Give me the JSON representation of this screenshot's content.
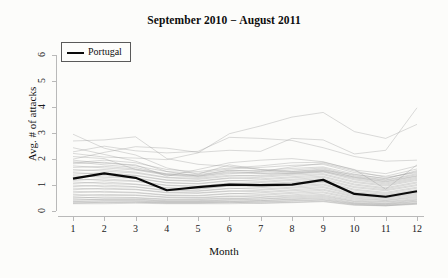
{
  "chart_data": {
    "type": "line",
    "title": "September 2010 − August 2011",
    "xlabel": "Month",
    "ylabel": "Avg. # of attacks",
    "xlim": [
      1,
      12
    ],
    "ylim": [
      0,
      6.4
    ],
    "x": [
      1,
      2,
      3,
      4,
      5,
      6,
      7,
      8,
      9,
      10,
      11,
      12
    ],
    "xticks": [
      "1",
      "2",
      "3",
      "4",
      "5",
      "6",
      "7",
      "8",
      "9",
      "10",
      "11",
      "12"
    ],
    "yticks": [
      "0",
      "1",
      "2",
      "3",
      "4",
      "5",
      "6"
    ],
    "grid": false,
    "legend": {
      "position": "top-left",
      "entries": [
        {
          "name": "Portugal",
          "color": "#0a0a0a",
          "width": 2.2
        }
      ]
    },
    "highlight_color": "#0a0a0a",
    "background_color": "#fcfcfa",
    "axis_color": "#b9b9b9",
    "background_series_color": "#9a9a9a",
    "series": [
      {
        "name": "Portugal",
        "highlight": true,
        "values": [
          1.25,
          1.45,
          1.28,
          0.8,
          0.92,
          1.02,
          1.0,
          1.02,
          1.2,
          0.66,
          0.55,
          0.76
        ]
      },
      {
        "name": "bg-01",
        "highlight": false,
        "values": [
          2.96,
          2.42,
          2.16,
          1.66,
          1.42,
          1.78,
          1.6,
          1.52,
          1.58,
          1.4,
          1.26,
          1.52
        ]
      },
      {
        "name": "bg-02",
        "highlight": false,
        "values": [
          2.7,
          2.74,
          2.86,
          2.02,
          1.8,
          1.72,
          1.6,
          1.48,
          1.56,
          1.32,
          1.18,
          1.4
        ]
      },
      {
        "name": "bg-03",
        "highlight": false,
        "values": [
          2.28,
          2.5,
          2.32,
          2.24,
          2.3,
          2.84,
          2.8,
          2.72,
          2.44,
          2.1,
          1.92,
          1.96
        ]
      },
      {
        "name": "bg-04",
        "highlight": false,
        "values": [
          2.22,
          2.08,
          2.04,
          1.98,
          2.24,
          2.98,
          3.28,
          3.62,
          3.8,
          3.06,
          2.8,
          3.34
        ]
      },
      {
        "name": "bg-05",
        "highlight": false,
        "values": [
          2.0,
          2.26,
          2.48,
          2.42,
          2.26,
          2.34,
          2.3,
          2.8,
          2.74,
          2.2,
          2.34,
          3.98
        ]
      },
      {
        "name": "bg-06",
        "highlight": false,
        "values": [
          1.9,
          1.78,
          1.68,
          1.42,
          1.36,
          1.58,
          1.52,
          1.7,
          1.84,
          1.54,
          1.3,
          1.48
        ]
      },
      {
        "name": "bg-07",
        "highlight": false,
        "values": [
          1.82,
          1.88,
          1.74,
          1.52,
          1.46,
          1.62,
          1.68,
          1.76,
          1.8,
          1.48,
          1.34,
          1.62
        ]
      },
      {
        "name": "bg-08",
        "highlight": false,
        "values": [
          1.74,
          1.66,
          1.58,
          1.38,
          1.3,
          1.44,
          1.5,
          1.58,
          1.66,
          1.36,
          1.2,
          1.44
        ]
      },
      {
        "name": "bg-09",
        "highlight": false,
        "values": [
          1.68,
          1.72,
          1.62,
          1.4,
          1.34,
          1.48,
          1.44,
          1.52,
          1.62,
          1.3,
          1.14,
          1.36
        ]
      },
      {
        "name": "bg-10",
        "highlight": false,
        "values": [
          1.6,
          1.54,
          1.46,
          1.28,
          1.22,
          1.34,
          1.38,
          1.46,
          1.54,
          1.24,
          1.08,
          1.3
        ]
      },
      {
        "name": "bg-11",
        "highlight": false,
        "values": [
          1.54,
          1.6,
          1.5,
          1.3,
          1.26,
          1.38,
          1.34,
          1.42,
          1.5,
          1.2,
          1.04,
          1.26
        ]
      },
      {
        "name": "bg-12",
        "highlight": false,
        "values": [
          1.48,
          1.42,
          1.36,
          1.18,
          1.14,
          1.26,
          1.3,
          1.38,
          1.44,
          1.14,
          1.0,
          1.22
        ]
      },
      {
        "name": "bg-13",
        "highlight": false,
        "values": [
          1.42,
          1.48,
          1.38,
          1.2,
          1.16,
          1.28,
          1.24,
          1.32,
          1.4,
          1.1,
          0.96,
          1.18
        ]
      },
      {
        "name": "bg-14",
        "highlight": false,
        "values": [
          1.36,
          1.3,
          1.26,
          1.08,
          1.04,
          1.16,
          1.2,
          1.28,
          1.34,
          1.04,
          0.9,
          1.12
        ]
      },
      {
        "name": "bg-15",
        "highlight": false,
        "values": [
          1.3,
          1.36,
          1.28,
          1.1,
          1.06,
          1.18,
          1.14,
          1.22,
          1.3,
          1.0,
          0.86,
          1.08
        ]
      },
      {
        "name": "bg-16",
        "highlight": false,
        "values": [
          1.24,
          1.18,
          1.14,
          0.98,
          0.94,
          1.06,
          1.1,
          1.18,
          1.24,
          0.94,
          0.82,
          1.02
        ]
      },
      {
        "name": "bg-17",
        "highlight": false,
        "values": [
          1.18,
          1.24,
          1.16,
          1.0,
          0.96,
          1.08,
          1.04,
          1.12,
          1.2,
          0.9,
          0.78,
          0.98
        ]
      },
      {
        "name": "bg-18",
        "highlight": false,
        "values": [
          1.12,
          1.06,
          1.02,
          0.88,
          0.84,
          0.96,
          1.0,
          1.08,
          1.14,
          0.84,
          0.72,
          0.92
        ]
      },
      {
        "name": "bg-19",
        "highlight": false,
        "values": [
          1.06,
          1.12,
          1.04,
          0.9,
          0.86,
          0.98,
          0.94,
          1.02,
          1.1,
          0.8,
          0.68,
          0.88
        ]
      },
      {
        "name": "bg-20",
        "highlight": false,
        "values": [
          1.0,
          0.94,
          0.92,
          0.78,
          0.76,
          0.86,
          0.9,
          0.98,
          1.04,
          0.74,
          0.64,
          0.82
        ]
      },
      {
        "name": "bg-21",
        "highlight": false,
        "values": [
          0.94,
          1.0,
          0.94,
          0.8,
          0.78,
          0.88,
          0.84,
          0.92,
          1.0,
          0.7,
          0.6,
          0.78
        ]
      },
      {
        "name": "bg-22",
        "highlight": false,
        "values": [
          0.88,
          0.84,
          0.82,
          0.7,
          0.68,
          0.76,
          0.8,
          0.88,
          0.94,
          0.66,
          0.56,
          0.72
        ]
      },
      {
        "name": "bg-23",
        "highlight": false,
        "values": [
          0.82,
          0.88,
          0.84,
          0.72,
          0.7,
          0.78,
          0.74,
          0.82,
          0.9,
          0.62,
          0.52,
          0.68
        ]
      },
      {
        "name": "bg-24",
        "highlight": false,
        "values": [
          0.76,
          0.72,
          0.7,
          0.6,
          0.58,
          0.66,
          0.7,
          0.78,
          0.84,
          0.58,
          0.5,
          0.64
        ]
      },
      {
        "name": "bg-25",
        "highlight": false,
        "values": [
          0.7,
          0.76,
          0.72,
          0.62,
          0.6,
          0.68,
          0.64,
          0.72,
          0.8,
          0.54,
          0.46,
          0.6
        ]
      },
      {
        "name": "bg-26",
        "highlight": false,
        "values": [
          0.64,
          0.6,
          0.6,
          0.52,
          0.5,
          0.56,
          0.6,
          0.68,
          0.74,
          0.5,
          0.42,
          0.56
        ]
      },
      {
        "name": "bg-27",
        "highlight": false,
        "values": [
          0.58,
          0.64,
          0.62,
          0.54,
          0.52,
          0.58,
          0.54,
          0.62,
          0.7,
          0.46,
          0.4,
          0.52
        ]
      },
      {
        "name": "bg-28",
        "highlight": false,
        "values": [
          0.54,
          0.5,
          0.5,
          0.44,
          0.44,
          0.48,
          0.52,
          0.58,
          0.64,
          0.42,
          0.36,
          0.48
        ]
      },
      {
        "name": "bg-29",
        "highlight": false,
        "values": [
          0.5,
          0.54,
          0.52,
          0.46,
          0.46,
          0.5,
          0.46,
          0.54,
          0.6,
          0.38,
          0.34,
          0.44
        ]
      },
      {
        "name": "bg-30",
        "highlight": false,
        "values": [
          0.46,
          0.44,
          0.44,
          0.38,
          0.38,
          0.42,
          0.46,
          0.5,
          0.56,
          0.36,
          0.3,
          0.42
        ]
      },
      {
        "name": "bg-31",
        "highlight": false,
        "values": [
          0.42,
          0.46,
          0.46,
          0.4,
          0.4,
          0.44,
          0.4,
          0.46,
          0.52,
          0.32,
          0.28,
          0.38
        ]
      },
      {
        "name": "bg-32",
        "highlight": false,
        "values": [
          0.38,
          0.38,
          0.38,
          0.34,
          0.34,
          0.36,
          0.4,
          0.44,
          0.48,
          0.3,
          0.26,
          0.36
        ]
      },
      {
        "name": "bg-33",
        "highlight": false,
        "values": [
          0.36,
          0.4,
          0.4,
          0.36,
          0.36,
          0.38,
          0.36,
          0.4,
          0.44,
          0.28,
          0.24,
          0.32
        ]
      },
      {
        "name": "bg-34",
        "highlight": false,
        "values": [
          0.32,
          0.32,
          0.34,
          0.3,
          0.3,
          0.32,
          0.34,
          0.38,
          0.42,
          0.26,
          0.22,
          0.3
        ]
      },
      {
        "name": "bg-35",
        "highlight": false,
        "values": [
          0.3,
          0.34,
          0.34,
          0.32,
          0.32,
          0.34,
          0.3,
          0.34,
          0.38,
          0.24,
          0.2,
          0.28
        ]
      },
      {
        "name": "bg-36",
        "highlight": false,
        "values": [
          0.28,
          0.28,
          0.3,
          0.28,
          0.28,
          0.28,
          0.3,
          0.32,
          0.36,
          0.22,
          0.2,
          0.26
        ]
      },
      {
        "name": "bg-37",
        "highlight": false,
        "values": [
          1.96,
          1.84,
          1.78,
          1.34,
          1.6,
          1.86,
          1.96,
          2.02,
          1.9,
          1.58,
          1.44,
          1.74
        ]
      },
      {
        "name": "bg-38",
        "highlight": false,
        "values": [
          2.44,
          2.18,
          1.92,
          1.52,
          1.34,
          1.52,
          1.46,
          1.44,
          1.52,
          1.28,
          1.12,
          1.34
        ]
      },
      {
        "name": "bg-39",
        "highlight": false,
        "values": [
          1.86,
          1.96,
          1.86,
          1.6,
          1.52,
          1.66,
          1.74,
          1.86,
          1.88,
          1.6,
          0.84,
          1.78
        ]
      },
      {
        "name": "bg-40",
        "highlight": false,
        "values": [
          2.1,
          2.02,
          1.6,
          1.44,
          1.4,
          1.56,
          1.56,
          1.64,
          1.7,
          1.42,
          1.24,
          1.56
        ]
      }
    ]
  },
  "figure": {
    "title": "September 2010 − August 2011",
    "x_axis_title": "Month",
    "y_axis_title": "Avg. # of attacks",
    "legend_label": "Portugal"
  }
}
